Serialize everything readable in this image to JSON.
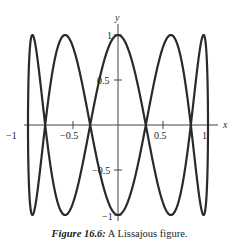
{
  "chart_data": {
    "type": "line",
    "title": "",
    "parametric": {
      "x": "sin(t)",
      "y": "cos(5t)",
      "t_range": [
        0,
        6.2832
      ]
    },
    "xlabel": "x",
    "ylabel": "y",
    "xlim": [
      -1,
      1
    ],
    "ylim": [
      -1,
      1
    ],
    "x_ticks": [
      -1,
      -0.5,
      0.5,
      1
    ],
    "x_tick_labels": [
      "−1",
      "−0.5",
      "0.5",
      "1"
    ],
    "y_ticks": [
      1,
      0.5,
      -0.5,
      -1
    ],
    "y_tick_labels": [
      "1",
      "0.5",
      "−0.5",
      "−1"
    ],
    "grid": false,
    "legend": null,
    "series": [
      {
        "name": "Lissajous curve",
        "color": "#2a2a2a"
      }
    ]
  },
  "caption": {
    "number": "Figure 16.6:",
    "text": "A Lissajous figure."
  }
}
